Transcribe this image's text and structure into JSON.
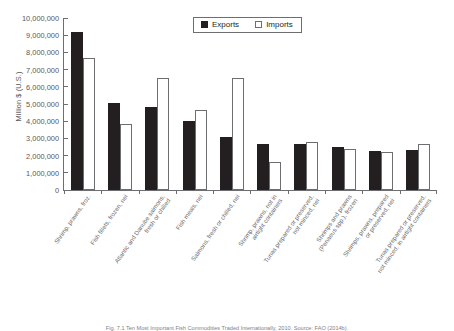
{
  "chart_data": {
    "type": "bar",
    "title": "",
    "subtitle": "",
    "xlabel": "",
    "ylabel": "Million $ (U.S.)",
    "ylim": [
      0,
      10000000
    ],
    "ytick_values": [
      10000000,
      9000000,
      8000000,
      7000000,
      6000000,
      5000000,
      4000000,
      3000000,
      2000000,
      1000000,
      0
    ],
    "ytick_labels": [
      "10,000,000",
      "9,000,000",
      "8,000,000",
      "7,000,000",
      "6,000,000",
      "5,000,000",
      "4,000,000",
      "3,000,000",
      "2,000,000",
      "1,000,000",
      "0"
    ],
    "grid": false,
    "legend_position": "top-center",
    "categories": [
      "Shrimp, prawns, froz.",
      "Fish fillets, frozen, nei",
      "Atlantic and Danube salmons,\nfresh or chilled",
      "Fish meals, nei",
      "Salmons, fresh or chilled, nei",
      "Shrimp, prawns, not in\nairtight containers",
      "Tunas prepared or preserved,\nnot minced, nei",
      "Shrimps and prawns\n(Penaeus spp.), frozen",
      "Shrimps, prawns, prepared\nor preserved, nei",
      "Tunas prepared or preserved,\nnot minced, in airtight containers"
    ],
    "series": [
      {
        "name": "Exports",
        "color": "#231f20",
        "values": [
          9200000,
          5050000,
          4800000,
          4000000,
          3100000,
          2700000,
          2700000,
          2500000,
          2250000,
          2350000
        ]
      },
      {
        "name": "Imports",
        "color": "#ffffff",
        "values": [
          7650000,
          3850000,
          6500000,
          4650000,
          6500000,
          1650000,
          2800000,
          2400000,
          2200000,
          2700000
        ]
      }
    ]
  },
  "legend": {
    "items": [
      {
        "label": "Exports",
        "swatch": "filled-square-icon"
      },
      {
        "label": "Imports",
        "swatch": "outlined-square-icon"
      }
    ]
  },
  "caption": {
    "text": "Fig. 7.1 Ten Most Important Fish Commodities Traded Internationally, 2010. Source: FAO (2014b)."
  }
}
